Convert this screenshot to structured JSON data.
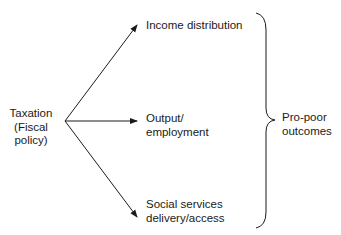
{
  "diagram": {
    "source": {
      "line1": "Taxation",
      "line2": "(Fiscal",
      "line3": "policy)"
    },
    "targets": [
      {
        "line1": "Income distribution",
        "line2": ""
      },
      {
        "line1": "Output/",
        "line2": "employment"
      },
      {
        "line1": "Social services",
        "line2": "delivery/access"
      }
    ],
    "outcome": {
      "line1": "Pro-poor",
      "line2": "outcomes"
    },
    "colors": {
      "line": "#1a1a1a",
      "text": "#1a1a1a",
      "background": "#ffffff"
    }
  }
}
